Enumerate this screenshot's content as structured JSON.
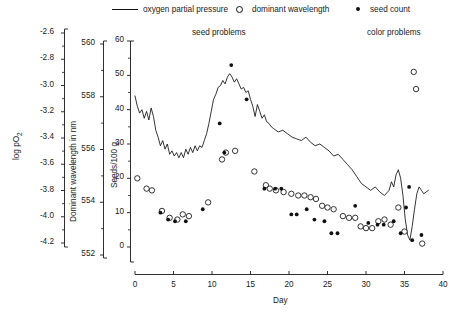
{
  "legend": {
    "items": [
      {
        "label": "oxygen partial pressure",
        "marker": "line-icon",
        "x": 112,
        "y": 2
      },
      {
        "label": "dominant wavelength",
        "marker": "open-circle-icon",
        "x": 236,
        "y": 2
      },
      {
        "label": "seed count",
        "marker": "filled-dot-icon",
        "x": 356,
        "y": 2
      }
    ]
  },
  "annotations": [
    {
      "text": "seed problems",
      "x": 192,
      "y": 28
    },
    {
      "text": "color problems",
      "x": 367,
      "y": 28
    }
  ],
  "axes": {
    "x": {
      "label": "Day",
      "ticks": [
        "0",
        "5",
        "10",
        "15",
        "20",
        "25",
        "30",
        "35",
        "40"
      ],
      "min": 0,
      "max": 40
    },
    "y_logpo2": {
      "label": "log pO",
      "label_sub": "2",
      "ticks": [
        "-2.6",
        "-2.8",
        "-3.0",
        "-3.2",
        "-3.4",
        "-3.6",
        "-3.8",
        "-4.0",
        "-4.2"
      ],
      "min": -4.2,
      "max": -2.6
    },
    "y_wavelength": {
      "label": "Dominant wavelength in nm",
      "ticks": [
        "560",
        "558",
        "556",
        "554",
        "552"
      ],
      "min": 552,
      "max": 560
    },
    "y_seeds": {
      "label": "Seeds/100 g",
      "ticks": [
        "60",
        "50",
        "40",
        "30",
        "20",
        "10",
        "0"
      ],
      "min": 0,
      "max": 60
    }
  },
  "chart_data": {
    "type": "line",
    "title": "",
    "xlabel": "Day",
    "ylabel": "Seeds/100 g",
    "xlim": [
      0,
      40
    ],
    "ylim": [
      0,
      60
    ],
    "grid": false,
    "legend_position": "top",
    "series": [
      {
        "name": "oxygen partial pressure",
        "type": "line",
        "axis": "log pO2",
        "x": [
          0.0,
          0.3,
          0.6,
          0.9,
          1.2,
          1.5,
          1.8,
          2.1,
          2.4,
          2.7,
          3.0,
          3.3,
          3.6,
          3.9,
          4.2,
          4.5,
          4.8,
          5.1,
          5.4,
          5.7,
          6.0,
          6.3,
          6.6,
          6.9,
          7.2,
          7.5,
          7.8,
          8.1,
          8.4,
          8.7,
          9.0,
          9.3,
          9.6,
          9.9,
          10.2,
          10.5,
          10.8,
          11.1,
          11.4,
          11.7,
          12.0,
          12.3,
          12.6,
          12.9,
          13.2,
          13.5,
          13.8,
          14.1,
          14.4,
          14.7,
          15.0,
          15.3,
          15.6,
          15.9,
          16.2,
          16.5,
          16.8,
          17.1,
          17.4,
          17.7,
          18.0,
          18.6,
          19.2,
          19.8,
          20.4,
          21.0,
          21.6,
          22.2,
          22.8,
          23.4,
          24.0,
          24.6,
          25.2,
          25.8,
          26.4,
          27.0,
          27.6,
          28.2,
          28.8,
          29.4,
          30.0,
          30.6,
          31.2,
          31.8,
          32.4,
          33.0,
          33.3,
          33.6,
          33.9,
          34.2,
          34.5,
          34.8,
          35.1,
          35.4,
          35.7,
          36.0,
          36.3,
          36.6,
          36.9,
          37.2,
          37.5,
          37.8,
          38.1
        ],
        "y": [
          44.0,
          41.0,
          39.0,
          40.0,
          37.5,
          39.5,
          37.0,
          40.5,
          38.0,
          34.0,
          32.0,
          29.5,
          31.0,
          28.5,
          30.0,
          27.0,
          28.0,
          26.5,
          27.5,
          26.0,
          27.5,
          26.0,
          28.5,
          27.0,
          29.0,
          27.5,
          29.5,
          28.0,
          29.5,
          29.0,
          31.0,
          33.0,
          36.0,
          39.5,
          43.0,
          44.5,
          46.5,
          47.0,
          48.5,
          47.5,
          49.5,
          50.5,
          49.5,
          48.0,
          49.0,
          47.5,
          46.0,
          46.5,
          45.0,
          45.5,
          43.0,
          41.0,
          38.0,
          41.5,
          39.5,
          37.5,
          38.5,
          36.5,
          36.0,
          35.0,
          34.5,
          33.5,
          34.0,
          33.0,
          32.0,
          31.5,
          31.0,
          32.0,
          30.5,
          29.5,
          30.0,
          29.0,
          28.0,
          26.5,
          27.0,
          25.5,
          24.0,
          22.5,
          20.5,
          18.5,
          17.5,
          16.5,
          17.5,
          16.0,
          15.0,
          16.5,
          19.0,
          17.5,
          21.0,
          22.5,
          20.0,
          15.0,
          8.0,
          3.5,
          2.0,
          6.0,
          11.0,
          15.5,
          17.5,
          16.5,
          15.5,
          16.0,
          16.5
        ]
      },
      {
        "name": "dominant wavelength",
        "type": "scatter",
        "marker": "open-circle",
        "axis": "Dominant wavelength in nm",
        "points": [
          [
            0.3,
            20.0
          ],
          [
            1.5,
            17.0
          ],
          [
            2.2,
            16.5
          ],
          [
            3.5,
            10.5
          ],
          [
            4.5,
            8.5
          ],
          [
            5.5,
            8.0
          ],
          [
            6.2,
            9.5
          ],
          [
            7.0,
            9.0
          ],
          [
            9.5,
            13.0
          ],
          [
            11.3,
            25.5
          ],
          [
            11.8,
            27.5
          ],
          [
            13.0,
            28.0
          ],
          [
            15.5,
            22.0
          ],
          [
            17.0,
            18.0
          ],
          [
            17.5,
            17.0
          ],
          [
            18.3,
            16.5
          ],
          [
            19.3,
            16.0
          ],
          [
            20.3,
            15.5
          ],
          [
            21.2,
            15.0
          ],
          [
            22.0,
            15.0
          ],
          [
            22.8,
            14.5
          ],
          [
            23.5,
            14.0
          ],
          [
            24.3,
            12.0
          ],
          [
            25.0,
            11.5
          ],
          [
            25.8,
            11.0
          ],
          [
            27.0,
            9.0
          ],
          [
            27.8,
            8.5
          ],
          [
            28.6,
            8.5
          ],
          [
            29.3,
            6.0
          ],
          [
            30.0,
            5.5
          ],
          [
            30.8,
            5.5
          ],
          [
            31.6,
            7.5
          ],
          [
            32.4,
            8.0
          ],
          [
            33.2,
            6.5
          ],
          [
            34.2,
            11.5
          ],
          [
            35.0,
            4.5
          ],
          [
            36.2,
            51.0
          ],
          [
            36.5,
            46.0
          ],
          [
            37.3,
            1.0
          ]
        ]
      },
      {
        "name": "seed count",
        "type": "scatter",
        "marker": "filled-dot",
        "axis": "Seeds/100 g",
        "points": [
          [
            3.3,
            10.0
          ],
          [
            4.3,
            8.0
          ],
          [
            5.2,
            7.5
          ],
          [
            6.6,
            7.5
          ],
          [
            8.8,
            11.0
          ],
          [
            11.0,
            36.0
          ],
          [
            11.6,
            27.5
          ],
          [
            12.5,
            53.0
          ],
          [
            14.5,
            43.0
          ],
          [
            16.8,
            17.0
          ],
          [
            18.2,
            17.0
          ],
          [
            19.0,
            17.0
          ],
          [
            20.3,
            9.5
          ],
          [
            21.0,
            9.5
          ],
          [
            22.3,
            11.0
          ],
          [
            23.3,
            8.0
          ],
          [
            24.6,
            7.5
          ],
          [
            25.5,
            4.0
          ],
          [
            26.3,
            4.0
          ],
          [
            28.6,
            12.0
          ],
          [
            30.3,
            7.0
          ],
          [
            31.5,
            6.5
          ],
          [
            32.3,
            6.5
          ],
          [
            33.6,
            7.5
          ],
          [
            34.5,
            4.0
          ],
          [
            35.2,
            11.5
          ],
          [
            35.6,
            17.5
          ],
          [
            36.0,
            2.0
          ],
          [
            37.2,
            3.5
          ]
        ]
      }
    ]
  }
}
